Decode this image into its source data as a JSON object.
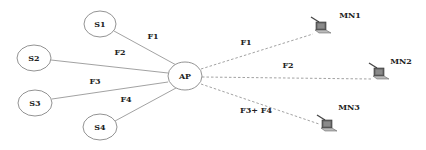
{
  "diagram": {
    "type": "network-topology",
    "colors": {
      "line": "#888888",
      "node_stroke": "#777777",
      "text": "#222222",
      "laptop": "#555555"
    },
    "hub": {
      "id": "AP",
      "label": "AP"
    },
    "sources": [
      {
        "id": "S1",
        "label": "S1"
      },
      {
        "id": "S2",
        "label": "S2"
      },
      {
        "id": "S3",
        "label": "S3"
      },
      {
        "id": "S4",
        "label": "S4"
      }
    ],
    "source_links": [
      {
        "from": "S1",
        "to": "AP",
        "label": "F1",
        "style": "solid"
      },
      {
        "from": "S2",
        "to": "AP",
        "label": "F2",
        "style": "solid"
      },
      {
        "from": "S3",
        "to": "AP",
        "label": "F3",
        "style": "solid"
      },
      {
        "from": "S4",
        "to": "AP",
        "label": "F4",
        "style": "solid"
      }
    ],
    "mobile_nodes": [
      {
        "id": "MN1",
        "label": "MN1",
        "icon": "laptop-icon"
      },
      {
        "id": "MN2",
        "label": "MN2",
        "icon": "laptop-icon"
      },
      {
        "id": "MN3",
        "label": "MN3",
        "icon": "laptop-icon"
      }
    ],
    "wireless_links": [
      {
        "from": "AP",
        "to": "MN1",
        "label": "F1",
        "style": "dashed"
      },
      {
        "from": "AP",
        "to": "MN2",
        "label": "F2",
        "style": "dashed"
      },
      {
        "from": "AP",
        "to": "MN3",
        "label": "F3+ F4",
        "style": "dashed"
      }
    ]
  }
}
